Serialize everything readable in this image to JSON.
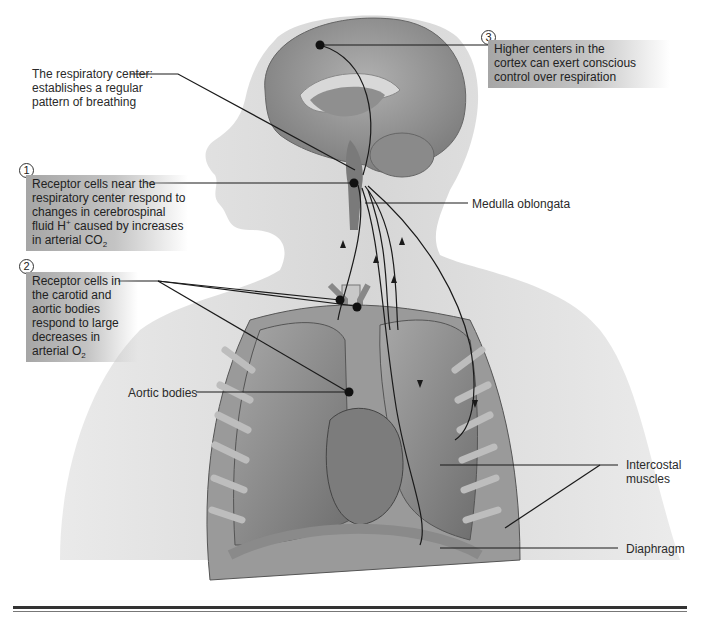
{
  "figure": {
    "labels": {
      "respiratory_center": [
        "The respiratory center:",
        "establishes a regular",
        "pattern of breathing"
      ],
      "medulla": "Medulla oblongata",
      "aortic_bodies": "Aortic bodies",
      "intercostal": [
        "Intercostal",
        "muscles"
      ],
      "diaphragm": "Diaphragm"
    },
    "callouts": [
      {
        "number": "1",
        "lines": [
          "Receptor cells near the",
          "respiratory center respond to",
          "changes in cerebrospinal",
          "fluid H",
          "caused by increases",
          "in arterial CO"
        ],
        "sup": "+",
        "sub": "2"
      },
      {
        "number": "2",
        "lines": [
          "Receptor cells in",
          "the carotid and",
          "aortic bodies",
          "respond to large",
          "decreases in",
          "arterial O"
        ],
        "sub": "2"
      },
      {
        "number": "3",
        "lines": [
          "Higher centers in the",
          "cortex can exert conscious",
          "control over respiration"
        ]
      }
    ],
    "colors": {
      "skin": "#d9d9d9",
      "brain": "#9a9a9a",
      "lung": "#8c8c8c",
      "line": "#1a1a1a"
    }
  }
}
